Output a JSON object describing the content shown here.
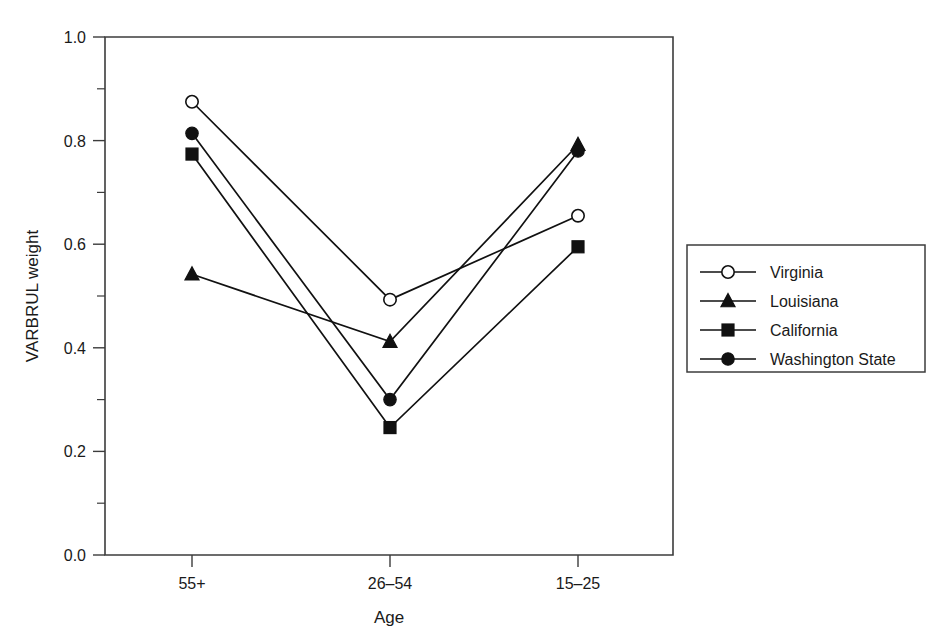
{
  "chart_data": {
    "type": "line",
    "title": "",
    "xlabel": "Age",
    "ylabel": "VARBRUL weight",
    "categories": [
      "55+",
      "26–54",
      "15–25"
    ],
    "ylim": [
      0.0,
      1.0
    ],
    "yticks": [
      "0.0",
      "0.2",
      "0.4",
      "0.6",
      "0.8",
      "1.0"
    ],
    "ytick_values": [
      0.0,
      0.2,
      0.4,
      0.6,
      0.8,
      1.0
    ],
    "minor_ytick_values": [
      0.1,
      0.3,
      0.5,
      0.7,
      0.9
    ],
    "grid": false,
    "legend_position": "right",
    "series": [
      {
        "name": "Virginia",
        "marker": "open-circle",
        "values": [
          0.875,
          0.493,
          0.655
        ]
      },
      {
        "name": "Louisiana",
        "marker": "filled-triangle",
        "values": [
          0.542,
          0.412,
          0.792
        ]
      },
      {
        "name": "California",
        "marker": "filled-square",
        "values": [
          0.774,
          0.246,
          0.595
        ]
      },
      {
        "name": "Washington State",
        "marker": "filled-circle",
        "values": [
          0.814,
          0.3,
          0.78
        ]
      }
    ]
  },
  "legend": {
    "entries": [
      {
        "label": "Virginia",
        "marker": "open-circle"
      },
      {
        "label": "Louisiana",
        "marker": "filled-triangle"
      },
      {
        "label": "California",
        "marker": "filled-square"
      },
      {
        "label": "Washington State",
        "marker": "filled-circle"
      }
    ]
  },
  "colors": {
    "ink": "#111111",
    "frame": "#3c3c3c",
    "background": "#ffffff"
  }
}
